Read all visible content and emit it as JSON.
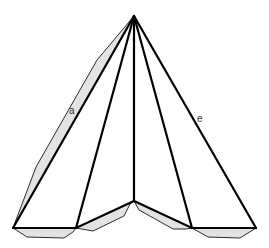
{
  "diagram": {
    "apex": [
      134,
      16
    ],
    "base_points": [
      [
        13,
        228
      ],
      [
        76,
        228
      ],
      [
        134,
        201
      ],
      [
        192,
        228
      ],
      [
        256,
        228
      ]
    ],
    "flaps": [
      {
        "name": "flap-left-side",
        "points": [
          [
            134,
            16
          ],
          [
            97,
            60
          ],
          [
            36,
            167
          ],
          [
            13,
            228
          ]
        ]
      },
      {
        "name": "flap-bottom-1",
        "points": [
          [
            13,
            228
          ],
          [
            27,
            237
          ],
          [
            64,
            238
          ],
          [
            73,
            232
          ],
          [
            76,
            228
          ]
        ]
      },
      {
        "name": "flap-bottom-2",
        "points": [
          [
            76,
            228
          ],
          [
            93,
            231
          ],
          [
            124,
            216
          ],
          [
            130,
            204
          ],
          [
            134,
            201
          ]
        ]
      },
      {
        "name": "flap-bottom-3",
        "points": [
          [
            134,
            201
          ],
          [
            139,
            210
          ],
          [
            173,
            229
          ],
          [
            186,
            229
          ],
          [
            192,
            228
          ]
        ]
      },
      {
        "name": "flap-bottom-4",
        "points": [
          [
            192,
            228
          ],
          [
            208,
            237
          ],
          [
            240,
            238
          ],
          [
            256,
            228
          ]
        ]
      }
    ],
    "labels": [
      {
        "name": "edge-label-a",
        "text": "a",
        "x": 69,
        "y": 106
      },
      {
        "name": "edge-label-e",
        "text": "e",
        "x": 197,
        "y": 114
      }
    ],
    "colors": {
      "flap_fill": "#e3e3e3",
      "edge": "#000000",
      "label": "#333333"
    }
  }
}
